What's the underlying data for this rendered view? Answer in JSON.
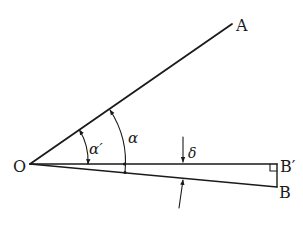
{
  "diagram": {
    "type": "geometry-angle-construction",
    "points": {
      "O": {
        "label": "O",
        "x": 30,
        "y": 164
      },
      "A": {
        "label": "A",
        "x": 232,
        "y": 24
      },
      "B_prime": {
        "label": "B′",
        "x": 277,
        "y": 164
      },
      "B": {
        "label": "B",
        "x": 277,
        "y": 187
      }
    },
    "angles": {
      "alpha_prime": {
        "label": "α′"
      },
      "alpha": {
        "label": "α"
      },
      "delta": {
        "label": "δ"
      }
    },
    "segments": [
      "OA",
      "OB′",
      "OB",
      "B′B"
    ],
    "right_angle_at": "B′",
    "colors": {
      "ink": "#1a1a1a",
      "background": "#ffffff"
    }
  }
}
